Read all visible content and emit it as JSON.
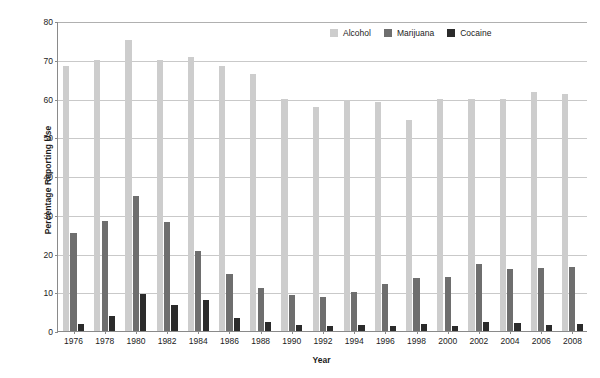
{
  "chart_data": {
    "type": "bar",
    "title": "",
    "xlabel": "Year",
    "ylabel": "Percentage Reporting Use",
    "ylim": [
      0,
      80
    ],
    "ytick_step": 10,
    "yticks": [
      0,
      10,
      20,
      30,
      40,
      50,
      60,
      70,
      80
    ],
    "grid": true,
    "legend_position": "top-right-inside",
    "categories": [
      "1976",
      "1978",
      "1980",
      "1982",
      "1984",
      "1986",
      "1988",
      "1990",
      "1992",
      "1994",
      "1996",
      "1998",
      "2000",
      "2002",
      "2004",
      "2006",
      "2008"
    ],
    "series": [
      {
        "name": "Alcohol",
        "color": "#cdcdcd",
        "values": [
          68.3,
          70.0,
          75.2,
          70.0,
          70.6,
          68.3,
          66.4,
          60.0,
          57.9,
          59.6,
          59.0,
          54.4,
          60.0,
          60.0,
          60.0,
          61.8,
          61.2
        ]
      },
      {
        "name": "Marijuana",
        "color": "#6e6e6e",
        "values": [
          25.3,
          28.4,
          34.8,
          28.2,
          20.7,
          14.8,
          11.2,
          9.4,
          8.8,
          10.1,
          12.2,
          13.6,
          14.0,
          17.3,
          16.1,
          16.3,
          16.5
        ]
      },
      {
        "name": "Cocaine",
        "color": "#2b2b2b",
        "values": [
          1.8,
          3.8,
          9.6,
          6.8,
          8.0,
          3.3,
          2.2,
          1.5,
          1.4,
          1.5,
          1.3,
          1.9,
          1.4,
          2.3,
          2.1,
          1.6,
          1.9
        ]
      }
    ]
  },
  "axes": {
    "y_title": "Percentage Reporting Use",
    "x_title": "Year"
  },
  "legend": {
    "items": [
      {
        "label": "Alcohol",
        "color": "#cdcdcd"
      },
      {
        "label": "Marijuana",
        "color": "#6e6e6e"
      },
      {
        "label": "Cocaine",
        "color": "#2b2b2b"
      }
    ]
  },
  "caption": {
    "fragment": ""
  }
}
